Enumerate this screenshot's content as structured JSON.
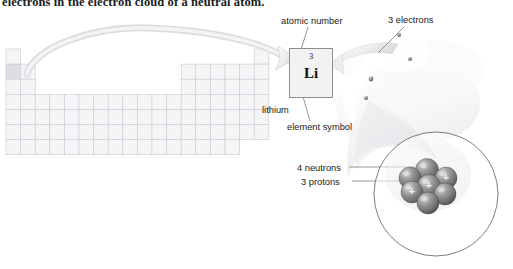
{
  "caption": {
    "text": "electrons in the electron cloud of a neutral atom."
  },
  "colors": {
    "grid_line": "#c9c9cf",
    "grid_fill": "#f5f5f7",
    "highlight_cell": "#dedee2",
    "element_box_border": "#8e8e8e",
    "element_box_fill": "#f2f2f2",
    "leader_line": "#8a8a8a",
    "cloud_light": "#fcfcfc",
    "cloud_shadow": "#d6d6da",
    "nucleus_sphere": "#7d7d7d",
    "nucleus_sphere_dark": "#565656",
    "nucleus_highlight": "#d8d8d8",
    "circle_stroke": "#6e6e6e",
    "electron_dot": "#6a6a72",
    "text": "#1a1a1a"
  },
  "element_box": {
    "name": "lithium-element-box",
    "atomic_number": "3",
    "symbol": "Li"
  },
  "labels": {
    "atomic_number": "atomic number",
    "three_electrons": "3 electrons",
    "lithium": "lithium",
    "element_symbol": "element symbol",
    "four_neutrons": "4 neutrons",
    "three_protons": "3 protons"
  },
  "periodic_table": {
    "name": "periodic-table-thumbnail",
    "cell_width": 14.6,
    "cell_height": 15.1,
    "origin_x": 6,
    "origin_y": 49,
    "columns": 18,
    "rows": 7,
    "highlight_cell": {
      "row": 2,
      "col": 1
    },
    "row_spans": [
      {
        "row": 1,
        "groups": [
          [
            1,
            1
          ],
          [
            18,
            18
          ]
        ]
      },
      {
        "row": 2,
        "groups": [
          [
            1,
            2
          ],
          [
            13,
            18
          ]
        ]
      },
      {
        "row": 3,
        "groups": [
          [
            1,
            2
          ],
          [
            13,
            18
          ]
        ]
      },
      {
        "row": 4,
        "groups": [
          [
            1,
            18
          ]
        ]
      },
      {
        "row": 5,
        "groups": [
          [
            1,
            18
          ]
        ]
      },
      {
        "row": 6,
        "groups": [
          [
            1,
            18
          ]
        ]
      },
      {
        "row": 7,
        "groups": [
          [
            1,
            16
          ]
        ]
      }
    ]
  },
  "electron_cloud": {
    "name": "electron-cloud",
    "electrons": [
      {
        "cx": 371,
        "cy": 79,
        "r": 2.4
      },
      {
        "cx": 399,
        "cy": 35,
        "r": 2.0
      },
      {
        "cx": 410,
        "cy": 59,
        "r": 2.1
      },
      {
        "cx": 366,
        "cy": 98,
        "r": 2.1
      }
    ],
    "electron_count": 3
  },
  "nucleus": {
    "name": "nucleus-magnifier",
    "circle": {
      "cx": 436,
      "cy": 194,
      "r": 62
    },
    "neutron_count": 4,
    "proton_count": 3,
    "proton_glyph": "+",
    "spheres": [
      {
        "cx": 427,
        "cy": 170,
        "r": 11.5,
        "type": "neutron"
      },
      {
        "cx": 410,
        "cy": 178,
        "r": 11.0,
        "type": "neutron"
      },
      {
        "cx": 446,
        "cy": 178,
        "r": 11.0,
        "type": "proton"
      },
      {
        "cx": 429,
        "cy": 186,
        "r": 11.5,
        "type": "proton"
      },
      {
        "cx": 412,
        "cy": 192,
        "r": 11.0,
        "type": "proton"
      },
      {
        "cx": 445,
        "cy": 194,
        "r": 11.0,
        "type": "neutron"
      },
      {
        "cx": 428,
        "cy": 203,
        "r": 11.0,
        "type": "neutron"
      }
    ]
  },
  "arrow": {
    "name": "periodic-table-to-element-arrow",
    "description": "curved arrow from lithium cell to enlarged element box"
  }
}
